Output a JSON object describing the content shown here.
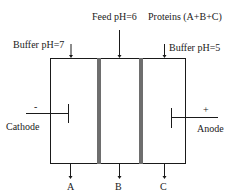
{
  "diagram": {
    "inlets": {
      "feed": "Feed pH=6",
      "proteins": "Proteins (A+B+C)",
      "buffer_left": "Buffer pH=7",
      "buffer_right": "Buffer pH=5"
    },
    "electrodes": {
      "cathode_label": "Cathode",
      "cathode_sign": "-",
      "anode_label": "Anode",
      "anode_sign": "+"
    },
    "outlets": [
      "A",
      "B",
      "C"
    ],
    "colors": {
      "line": "#1a1a1a",
      "membrane": "#6e6e6e"
    }
  }
}
